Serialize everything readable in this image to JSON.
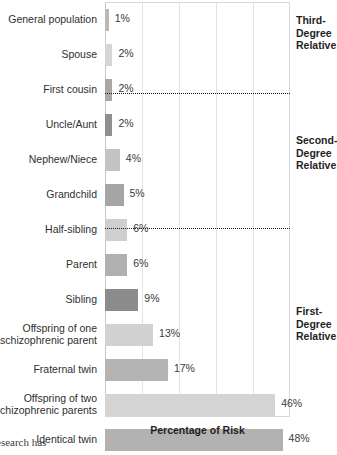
{
  "chart_data": {
    "type": "bar",
    "orientation": "horizontal",
    "title": "",
    "xlabel": "Percentage of Risk",
    "ylabel": "",
    "xlim": [
      0,
      50
    ],
    "grid": true,
    "gridline_interval": 10,
    "legend": "none",
    "categories": [
      "General population",
      "Spouse",
      "First cousin",
      "Uncle/Aunt",
      "Nephew/Niece",
      "Grandchild",
      "Half-sibling",
      "Parent",
      "Sibling",
      "Offspring of one\nschizophrenic parent",
      "Fraternal twin",
      "Offspring of two\nschizophrenic parents",
      "Identical twin"
    ],
    "values": [
      1,
      2,
      2,
      2,
      4,
      5,
      6,
      6,
      9,
      13,
      17,
      46,
      48
    ],
    "value_labels": [
      "1%",
      "2%",
      "2%",
      "2%",
      "4%",
      "5%",
      "6%",
      "6%",
      "9%",
      "13%",
      "17%",
      "46%",
      "48%"
    ],
    "bar_colors": [
      "#b8b8b8",
      "#d5d5d5",
      "#a8a8a8",
      "#8f8f8f",
      "#c3c3c3",
      "#a5a5a5",
      "#cfcfcf",
      "#b0b0b0",
      "#8c8c8c",
      "#d2d2d2",
      "#b4b4b4",
      "#d4d4d4",
      "#b2b2b2"
    ],
    "annotations": [
      {
        "label": "Third-\nDegree\nRelative",
        "group_categories": [
          "General population",
          "Spouse",
          "First cousin"
        ]
      },
      {
        "label": "Second-\nDegree\nRelative",
        "group_categories": [
          "Uncle/Aunt",
          "Nephew/Niece",
          "Grandchild",
          "Half-sibling"
        ]
      },
      {
        "label": "First-\nDegree\nRelative",
        "group_categories": [
          "Parent",
          "Sibling",
          "Offspring of one schizophrenic parent",
          "Fraternal twin",
          "Offspring of two schizophrenic parents",
          "Identical twin"
        ]
      }
    ],
    "separators": [
      3,
      7
    ]
  },
  "groups": [
    {
      "label": "Third-\nDegree\nRelative"
    },
    {
      "label": "Second-\nDegree\nRelative"
    },
    {
      "label": "First-\nDegree\nRelative"
    }
  ],
  "page": {
    "bleed_text": "esearch has"
  }
}
